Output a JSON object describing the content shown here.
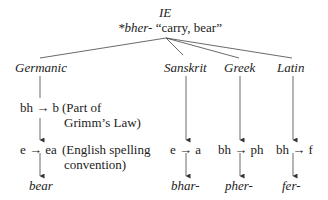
{
  "root": {
    "label": "IE",
    "form": "*bher-",
    "gloss": "“carry, bear”"
  },
  "branches": [
    {
      "name": "Germanic",
      "steps": [
        {
          "change": "bh → b",
          "note_line1": "(Part of",
          "note_line2": "Grimm’s Law)"
        },
        {
          "change": "e → ea",
          "note_line1": "(English spelling",
          "note_line2": "convention)"
        }
      ],
      "result": "bear"
    },
    {
      "name": "Sanskrit",
      "steps": [
        {
          "change": "e → a"
        }
      ],
      "result": "bhar-"
    },
    {
      "name": "Greek",
      "steps": [
        {
          "change": "bh → ph"
        }
      ],
      "result": "pher-"
    },
    {
      "name": "Latin",
      "steps": [
        {
          "change": "bh → f"
        }
      ],
      "result": "fer-"
    }
  ]
}
